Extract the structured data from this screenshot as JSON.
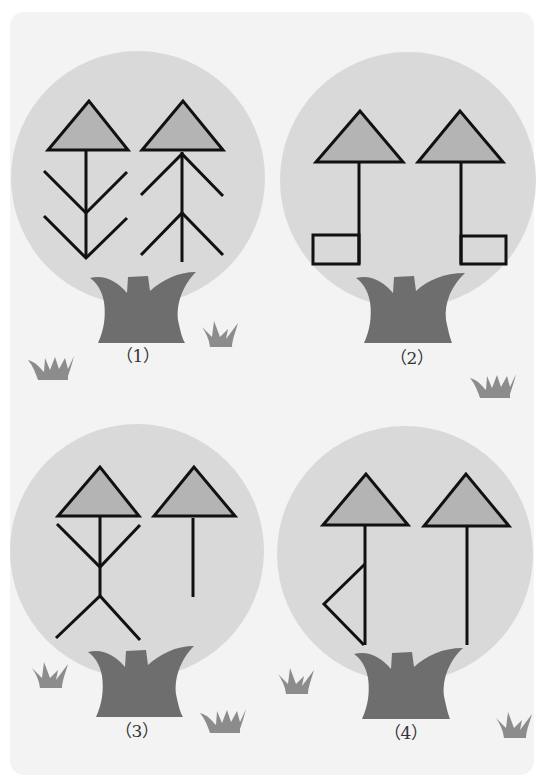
{
  "colors": {
    "background": "#ffffff",
    "card": "#f3f3f3",
    "canopy": "#d9d9d9",
    "triangle_fill": "#b4b4b4",
    "stroke": "#111111",
    "trunk": "#6e6e6e",
    "grass": "#8c8c8c"
  },
  "panels": [
    {
      "id": 1,
      "label": "（1）",
      "figure_left": "arrow with two downward chevrons (feather shape)",
      "figure_right": "arrow with two upward chevrons (tree shape)"
    },
    {
      "id": 2,
      "label": "（2）",
      "figure_left": "arrow with rectangle at bottom-left",
      "figure_right": "arrow with rectangle at bottom-right"
    },
    {
      "id": 3,
      "label": "（3）",
      "figure_left": "arrow with arms and legs (stick figure)",
      "figure_right": "plain short arrow"
    },
    {
      "id": 4,
      "label": "（4）",
      "figure_left": "arrow with triangular flag on left",
      "figure_right": "plain long arrow"
    }
  ]
}
